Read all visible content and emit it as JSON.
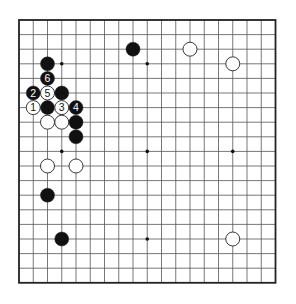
{
  "board": {
    "size": 19,
    "origin_x": 19,
    "origin_y": 20,
    "step_x": 14.25,
    "step_y": 14.6,
    "stone_radius": 7,
    "colors": {
      "black": "#111111",
      "white": "#ffffff",
      "grid": "#555555",
      "border": "#222222"
    }
  },
  "star_points": [
    [
      3,
      3
    ],
    [
      9,
      3
    ],
    [
      15,
      3
    ],
    [
      3,
      9
    ],
    [
      9,
      9
    ],
    [
      15,
      9
    ],
    [
      3,
      15
    ],
    [
      9,
      15
    ],
    [
      15,
      15
    ]
  ],
  "stones": [
    {
      "color": "black",
      "col": 2,
      "row": 3,
      "label": ""
    },
    {
      "color": "black",
      "col": 8,
      "row": 2,
      "label": ""
    },
    {
      "color": "white",
      "col": 12,
      "row": 2,
      "label": ""
    },
    {
      "color": "white",
      "col": 15,
      "row": 3,
      "label": ""
    },
    {
      "color": "black",
      "col": 2,
      "row": 4,
      "label": "6"
    },
    {
      "color": "black",
      "col": 1,
      "row": 5,
      "label": "2"
    },
    {
      "color": "white",
      "col": 2,
      "row": 5,
      "label": "5"
    },
    {
      "color": "black",
      "col": 3,
      "row": 5,
      "label": ""
    },
    {
      "color": "white",
      "col": 1,
      "row": 6,
      "label": "1"
    },
    {
      "color": "black",
      "col": 2,
      "row": 6,
      "label": ""
    },
    {
      "color": "white",
      "col": 3,
      "row": 6,
      "label": "3"
    },
    {
      "color": "black",
      "col": 4,
      "row": 6,
      "label": "4"
    },
    {
      "color": "white",
      "col": 2,
      "row": 7,
      "label": ""
    },
    {
      "color": "white",
      "col": 3,
      "row": 7,
      "label": ""
    },
    {
      "color": "black",
      "col": 4,
      "row": 7,
      "label": ""
    },
    {
      "color": "black",
      "col": 4,
      "row": 8,
      "label": ""
    },
    {
      "color": "white",
      "col": 2,
      "row": 10,
      "label": ""
    },
    {
      "color": "white",
      "col": 4,
      "row": 10,
      "label": ""
    },
    {
      "color": "black",
      "col": 2,
      "row": 12,
      "label": ""
    },
    {
      "color": "black",
      "col": 3,
      "row": 15,
      "label": ""
    },
    {
      "color": "white",
      "col": 15,
      "row": 15,
      "label": ""
    }
  ]
}
